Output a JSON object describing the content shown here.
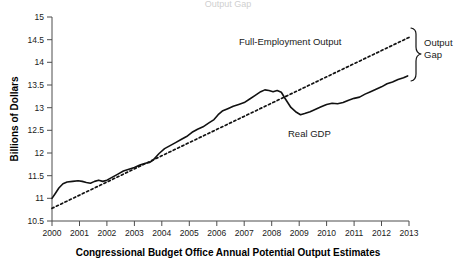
{
  "chart_data": {
    "type": "line",
    "title": "Output Gap",
    "xlabel": "Congressional Budget Office Annual Potential Output Estimates",
    "ylabel": "Billions of Dollars",
    "xlim": [
      2000,
      2013
    ],
    "ylim": [
      10.5,
      15
    ],
    "grid": false,
    "legend_position": "inline-annotations",
    "xticks": [
      "2000",
      "2001",
      "2002",
      "2003",
      "2004",
      "2005",
      "2006",
      "2007",
      "2008",
      "2009",
      "2010",
      "2011",
      "2012",
      "2013"
    ],
    "xtick_values": [
      2000,
      2001,
      2002,
      2003,
      2004,
      2005,
      2006,
      2007,
      2008,
      2009,
      2010,
      2011,
      2012,
      2013
    ],
    "yticks": [
      "10.5",
      "11",
      "11.5",
      "12",
      "12.5",
      "13",
      "13.5",
      "14",
      "14.5",
      "15"
    ],
    "ytick_values": [
      10.5,
      11,
      11.5,
      12,
      12.5,
      13,
      13.5,
      14,
      14.5,
      15
    ],
    "annotations": [
      {
        "text": "Full-Employment Output",
        "x": 2006.3,
        "y": 14.07
      },
      {
        "text": "Real GDP",
        "x": 2009.2,
        "y": 12.42
      },
      {
        "text": "Output",
        "x": 2013.35,
        "y": 14.34
      },
      {
        "text": "Gap",
        "x": 2013.35,
        "y": 14.08
      }
    ],
    "series": [
      {
        "name": "Real GDP",
        "style": "solid",
        "x": [
          2000.0,
          2000.12,
          2000.25,
          2000.4,
          2000.55,
          2000.75,
          2000.95,
          2001.1,
          2001.25,
          2001.4,
          2001.55,
          2001.7,
          2001.85,
          2002.0,
          2002.2,
          2002.4,
          2002.6,
          2002.8,
          2003.0,
          2003.2,
          2003.4,
          2003.55,
          2003.7,
          2003.9,
          2004.1,
          2004.3,
          2004.5,
          2004.7,
          2004.9,
          2005.1,
          2005.3,
          2005.5,
          2005.7,
          2005.9,
          2006.05,
          2006.2,
          2006.4,
          2006.6,
          2006.8,
          2007.0,
          2007.2,
          2007.4,
          2007.6,
          2007.75,
          2007.9,
          2008.05,
          2008.2,
          2008.35,
          2008.5,
          2008.7,
          2008.9,
          2009.05,
          2009.2,
          2009.4,
          2009.6,
          2009.8,
          2010.0,
          2010.2,
          2010.4,
          2010.6,
          2010.8,
          2011.0,
          2011.2,
          2011.4,
          2011.6,
          2011.8,
          2012.0,
          2012.2,
          2012.4,
          2012.6,
          2012.8,
          2012.95
        ],
        "y": [
          10.98,
          11.06,
          11.15,
          11.22,
          11.25,
          11.26,
          11.27,
          11.26,
          11.24,
          11.23,
          11.26,
          11.28,
          11.26,
          11.28,
          11.33,
          11.38,
          11.43,
          11.46,
          11.49,
          11.53,
          11.56,
          11.57,
          11.62,
          11.72,
          11.8,
          11.85,
          11.9,
          11.95,
          12.0,
          12.07,
          12.12,
          12.16,
          12.22,
          12.28,
          12.36,
          12.42,
          12.46,
          12.5,
          12.53,
          12.56,
          12.62,
          12.68,
          12.74,
          12.77,
          12.76,
          12.74,
          12.76,
          12.73,
          12.62,
          12.48,
          12.4,
          12.36,
          12.38,
          12.41,
          12.45,
          12.49,
          12.53,
          12.55,
          12.54,
          12.56,
          12.6,
          12.63,
          12.65,
          12.7,
          12.74,
          12.78,
          12.82,
          12.87,
          12.9,
          12.94,
          12.97,
          13.0
        ],
        "y_scale_note": "values rendered against axis 10.5 to 15"
      },
      {
        "name": "Full-Employment Output",
        "style": "dashed",
        "x": [
          2000.0,
          2013.0
        ],
        "y": [
          10.78,
          14.55
        ]
      }
    ],
    "real_gdp_readings": {
      "2000": 11.0,
      "2001": 11.25,
      "2002": 11.28,
      "2003": 11.5,
      "2004": 11.8,
      "2005": 12.05,
      "2006": 12.38,
      "2007": 13.05,
      "2008": 13.28,
      "2009_trough": 12.68,
      "2010": 12.95,
      "2011": 13.2,
      "2012": 13.45,
      "2013": 13.7
    },
    "full_employment_readings": {
      "2000": 10.78,
      "2013": 14.55
    },
    "output_gap_2013": 0.85
  },
  "colors": {
    "line": "#111111",
    "axis": "#4d4d4d",
    "text": "#1a1a1a",
    "background": "#ffffff",
    "faint_title": "#cfcfcf"
  }
}
